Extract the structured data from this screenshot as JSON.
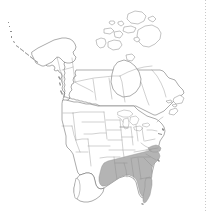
{
  "figure": {
    "title": "North America Distribution Map",
    "projection": "Lambert conformal conic",
    "background_color": "#ffffff",
    "outline_color": "#585858",
    "subdivision_color": "#8a8a8a",
    "shade_color": "#b4b4b4",
    "width_px": 208,
    "height_px": 213
  },
  "legend": {
    "shaded_meaning": "present",
    "unshaded_meaning": "absent",
    "shade_color": "#b4b4b4",
    "unshaded_color": "#ffffff"
  },
  "regions": {
    "countries": [
      {
        "name": "United States",
        "shaded": "partial"
      },
      {
        "name": "Canada",
        "shaded": "none"
      },
      {
        "name": "Mexico",
        "shaded": "none"
      }
    ],
    "shaded_states": [
      "Texas (east)",
      "Louisiana",
      "Arkansas",
      "Mississippi",
      "Alabama",
      "Georgia",
      "Florida",
      "South Carolina",
      "North Carolina",
      "Tennessee",
      "Virginia"
    ],
    "unshaded_states_note": "All remaining United States states, all Canadian provinces and territories, and Mexico are unshaded."
  },
  "features": [
    {
      "name": "alaska",
      "label": "Alaska"
    },
    {
      "name": "aleutian-islands",
      "label": "Aleutian Islands"
    },
    {
      "name": "canadian-arctic-archipelago",
      "label": "Canadian Arctic Archipelago"
    },
    {
      "name": "hudson-bay",
      "label": "Hudson Bay"
    },
    {
      "name": "great-lakes",
      "label": "Great Lakes"
    },
    {
      "name": "florida-peninsula",
      "label": "Florida Peninsula"
    },
    {
      "name": "newfoundland",
      "label": "Newfoundland"
    },
    {
      "name": "baja-california",
      "label": "Baja California"
    }
  ],
  "artifacts": {
    "right_edge_dotted_line": "faint dotted scan artifact along right margin"
  }
}
